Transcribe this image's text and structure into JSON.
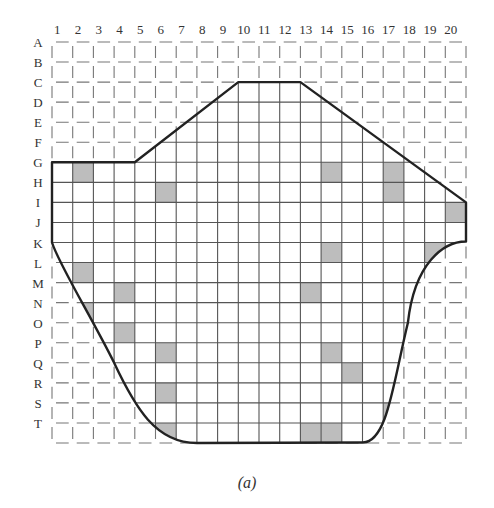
{
  "figure": {
    "caption": "(a)",
    "columns": [
      "1",
      "2",
      "3",
      "4",
      "5",
      "6",
      "7",
      "8",
      "9",
      "10",
      "11",
      "12",
      "13",
      "14",
      "15",
      "16",
      "17",
      "18",
      "19",
      "20"
    ],
    "rows": [
      "A",
      "B",
      "C",
      "D",
      "E",
      "F",
      "G",
      "H",
      "I",
      "J",
      "K",
      "L",
      "M",
      "N",
      "O",
      "P",
      "Q",
      "R",
      "S",
      "T"
    ],
    "grid": {
      "left": 52,
      "top": 42,
      "cell_width": 20.7,
      "cell_height": 20.05
    },
    "colors": {
      "shade": "#bdbdbd",
      "line": "#555555",
      "outline": "#222222",
      "dashed": "#777777"
    },
    "outline_description": "Hexagonal top (G1-G4 flat, diagonal up to C10, flat C10-C12, diagonal down to I20), vertical right edge I-J, curved sides tapering to flat bottom at T",
    "shaded_cells": [
      {
        "row": "G",
        "col": 2
      },
      {
        "row": "G",
        "col": 14
      },
      {
        "row": "G",
        "col": 17,
        "partial": true
      },
      {
        "row": "H",
        "col": 6
      },
      {
        "row": "H",
        "col": 17
      },
      {
        "row": "I",
        "col": 20
      },
      {
        "row": "K",
        "col": 14
      },
      {
        "row": "K",
        "col": 19
      },
      {
        "row": "L",
        "col": 2
      },
      {
        "row": "M",
        "col": 4
      },
      {
        "row": "M",
        "col": 13
      },
      {
        "row": "N",
        "col": 2,
        "partial": true
      },
      {
        "row": "O",
        "col": 4
      },
      {
        "row": "P",
        "col": 6
      },
      {
        "row": "P",
        "col": 14
      },
      {
        "row": "Q",
        "col": 15
      },
      {
        "row": "R",
        "col": 6
      },
      {
        "row": "S",
        "col": 17,
        "partial": true
      },
      {
        "row": "T",
        "col": 6,
        "partial": true
      },
      {
        "row": "T",
        "col": 13
      },
      {
        "row": "T",
        "col": 14
      }
    ]
  }
}
